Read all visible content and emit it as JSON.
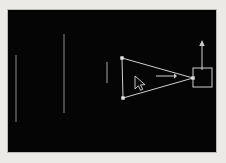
{
  "app": {
    "window_title": "",
    "background_color": "#eceae6",
    "canvas_color": "#050505",
    "stroke_color": "#cfcfcf",
    "guide_color": "#6d6d6d"
  },
  "viewport": {
    "name": "3d-wireframe-viewport",
    "width": 208,
    "height": 142,
    "origin_x": 8,
    "origin_y": 10
  },
  "scene": {
    "objects": [
      {
        "id": "cone-wireframe",
        "type": "triangle",
        "label": "",
        "points": "114,48 185,68 115,88",
        "vertices": [
          {
            "x": 114,
            "y": 48
          },
          {
            "x": 185,
            "y": 68
          },
          {
            "x": 115,
            "y": 88
          }
        ]
      },
      {
        "id": "target-square",
        "type": "rectangle",
        "label": "",
        "x": 185,
        "y": 58,
        "width": 19,
        "height": 19
      }
    ],
    "direction_arrows": [
      {
        "id": "horizontal-direction-arrow",
        "orientation": "right",
        "x1": 148,
        "y1": 66,
        "x2": 166,
        "y2": 66
      },
      {
        "id": "vertical-direction-arrow",
        "orientation": "up",
        "x1": 194,
        "y1": 60,
        "x2": 194,
        "y2": 30
      }
    ],
    "guide_lines": [
      {
        "id": "guide-line-left",
        "x": 8,
        "y1": 45,
        "y2": 112
      },
      {
        "id": "guide-line-middle",
        "x": 56,
        "y1": 24,
        "y2": 103
      },
      {
        "id": "guide-line-short",
        "x": 99,
        "y1": 52,
        "y2": 73
      }
    ],
    "cursor": {
      "id": "mouse-cursor",
      "x": 127,
      "y": 66,
      "type": "arrow-pointer"
    }
  }
}
